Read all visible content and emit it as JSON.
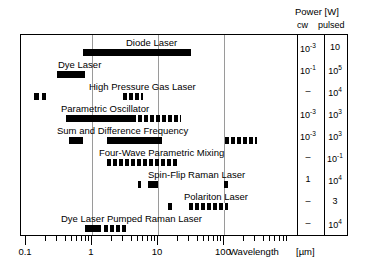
{
  "header": {
    "power_title": "Power [W]",
    "cw_label": "cw",
    "pulsed_label": "pulsed"
  },
  "axis": {
    "title": "Wavelength",
    "unit": "[µm]",
    "ticks": [
      "0.1",
      "1",
      "10",
      "100"
    ]
  },
  "chart_data": {
    "type": "bar",
    "xlabel": "Wavelength [µm]",
    "ylabel": "",
    "xscale": "log",
    "xlim": [
      0.1,
      320
    ],
    "grid": true,
    "legend": "none",
    "columns": [
      "Laser type",
      "Wavelength range [µm]",
      "cw power [W]",
      "pulsed power [W]"
    ],
    "rows": [
      {
        "label": "Diode Laser",
        "label_x": 105,
        "cw": "10⁻³",
        "cw_base": "10",
        "cw_exp": "-3",
        "pulsed": "10",
        "pulsed_base": "10",
        "pulsed_exp": "",
        "segments": [
          {
            "start": 0.72,
            "end": 32.0,
            "style": "solid"
          }
        ]
      },
      {
        "label": "Dye Laser",
        "label_x": 37,
        "cw": "10⁻¹",
        "cw_base": "10",
        "cw_exp": "-1",
        "pulsed": "10⁵",
        "pulsed_base": "10",
        "pulsed_exp": "5",
        "segments": [
          {
            "start": 0.3,
            "end": 0.78,
            "style": "solid"
          }
        ]
      },
      {
        "label": "High Pressure Gas Laser",
        "label_x": 68,
        "cw": "–",
        "cw_base": "–",
        "cw_exp": "",
        "pulsed": "10⁴",
        "pulsed_base": "10",
        "pulsed_exp": "4",
        "segments": [
          {
            "start": 0.13,
            "end": 0.155,
            "style": "solid"
          },
          {
            "start": 0.175,
            "end": 0.2,
            "style": "solid"
          },
          {
            "start": 3.0,
            "end": 6.0,
            "style": "dash"
          }
        ]
      },
      {
        "label": "Parametric Oscillator",
        "label_x": 40,
        "cw": "10⁻³",
        "cw_base": "10",
        "cw_exp": "-3",
        "pulsed": "10³",
        "pulsed_base": "10",
        "pulsed_exp": "3",
        "segments": [
          {
            "start": 0.4,
            "end": 4.0,
            "style": "solid"
          },
          {
            "start": 4.0,
            "end": 22.0,
            "style": "dash"
          }
        ]
      },
      {
        "label": "Sum        and        Difference                  Frequency",
        "label_x": 36,
        "cw": "10⁻³",
        "cw_base": "10",
        "cw_exp": "-3",
        "pulsed": "10³",
        "pulsed_base": "10",
        "pulsed_exp": "3",
        "segments": [
          {
            "start": 0.45,
            "end": 0.72,
            "style": "solid"
          },
          {
            "start": 1.7,
            "end": 11.5,
            "style": "solid"
          },
          {
            "start": 105.0,
            "end": 320.0,
            "style": "dash"
          }
        ]
      },
      {
        "label": "Four-Wave Parametric   Mixing",
        "label_x": 78,
        "cw": "–",
        "cw_base": "–",
        "cw_exp": "",
        "pulsed": "10⁻¹",
        "pulsed_base": "10",
        "pulsed_exp": "-1",
        "segments": [
          {
            "start": 1.7,
            "end": 21.0,
            "style": "dash"
          }
        ]
      },
      {
        "label": "Spin-Flip Raman Laser",
        "label_x": 127,
        "cw": "1",
        "cw_base": "1",
        "cw_exp": "",
        "pulsed": "10⁴",
        "pulsed_base": "10",
        "pulsed_exp": "4",
        "segments": [
          {
            "start": 5.0,
            "end": 5.6,
            "style": "solid"
          },
          {
            "start": 7.0,
            "end": 10.0,
            "style": "solid"
          },
          {
            "start": 100.0,
            "end": 118.0,
            "style": "dash"
          }
        ]
      },
      {
        "label": "Polariton Laser",
        "label_x": 163,
        "cw": "–",
        "cw_base": "–",
        "cw_exp": "",
        "pulsed": "3",
        "pulsed_base": "3",
        "pulsed_exp": "",
        "segments": [
          {
            "start": 14.0,
            "end": 17.0,
            "style": "dash"
          },
          {
            "start": 29.0,
            "end": 115.0,
            "style": "dash"
          }
        ]
      },
      {
        "label": "Dye Laser Pumped Raman Laser",
        "label_x": 40,
        "cw": "–",
        "cw_base": "–",
        "cw_exp": "",
        "pulsed": "10⁴",
        "pulsed_base": "10",
        "pulsed_exp": "4",
        "segments": [
          {
            "start": 0.78,
            "end": 1.35,
            "style": "solid"
          },
          {
            "start": 1.5,
            "end": 3.4,
            "style": "dash"
          }
        ]
      }
    ]
  }
}
